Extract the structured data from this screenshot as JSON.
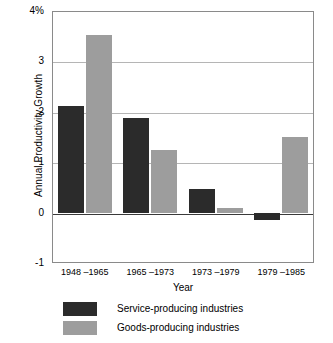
{
  "chart_data": {
    "type": "bar",
    "title": "",
    "xlabel": "Year",
    "ylabel": "Annual Productivity Growth",
    "categories": [
      "1948 –1965",
      "1965 –1973",
      "1973 –1979",
      "1979 –1985"
    ],
    "series": [
      {
        "name": "Service-producing industries",
        "color": "#2b2b2b",
        "values": [
          2.12,
          1.88,
          0.47,
          -0.15
        ]
      },
      {
        "name": "Goods-producing industries",
        "color": "#9d9d9d",
        "values": [
          3.52,
          1.25,
          0.1,
          1.5
        ]
      }
    ],
    "ylim": [
      -1,
      4
    ],
    "ytick_values": [
      4,
      3,
      2,
      1,
      0,
      -1
    ],
    "ytick_labels": [
      "4%",
      "3",
      "2",
      "1",
      "0",
      "-1"
    ],
    "grid": true,
    "legend_position": "bottom-left"
  },
  "axes": {
    "y_title": "Annual Productivity Growth",
    "x_title": "Year"
  },
  "legend": {
    "items": [
      {
        "label": "Service-producing industries",
        "swatch": "service"
      },
      {
        "label": "Goods-producing industries",
        "swatch": "goods"
      }
    ]
  }
}
